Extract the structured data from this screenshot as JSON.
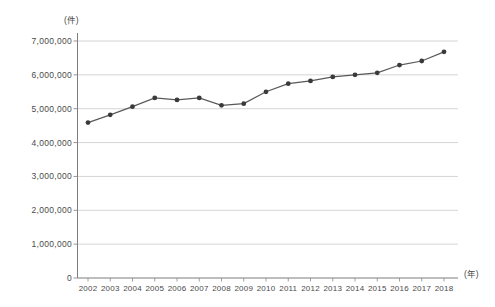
{
  "chart_data": {
    "type": "line",
    "title": "",
    "xlabel": "(年)",
    "ylabel": "(件)",
    "categories": [
      "2002",
      "2003",
      "2004",
      "2005",
      "2006",
      "2007",
      "2008",
      "2009",
      "2010",
      "2011",
      "2012",
      "2013",
      "2014",
      "2015",
      "2016",
      "2017",
      "2018"
    ],
    "values": [
      4590000,
      4820000,
      5060000,
      5320000,
      5260000,
      5320000,
      5100000,
      5150000,
      5500000,
      5740000,
      5820000,
      5940000,
      6000000,
      6060000,
      6290000,
      6410000,
      6680000
    ],
    "series": [
      {
        "name": "件数",
        "values": [
          4590000,
          4820000,
          5060000,
          5320000,
          5260000,
          5320000,
          5100000,
          5150000,
          5500000,
          5740000,
          5820000,
          5940000,
          6000000,
          6060000,
          6290000,
          6410000,
          6680000
        ]
      }
    ],
    "ylim": [
      0,
      7000000
    ],
    "ytick_values": [
      7000000,
      6000000,
      5000000,
      4000000,
      3000000,
      2000000,
      1000000,
      0
    ],
    "ytick_labels": [
      "7,000,000",
      "6,000,000",
      "5,000,000",
      "4,000,000",
      "3,000,000",
      "2,000,000",
      "1,000,000",
      "0"
    ],
    "grid": true,
    "legend": "none",
    "line_color": "#595959",
    "marker_color": "#3a3a3a",
    "grid_color": "#c9c9c9",
    "axis_color": "#8a8a8a"
  }
}
